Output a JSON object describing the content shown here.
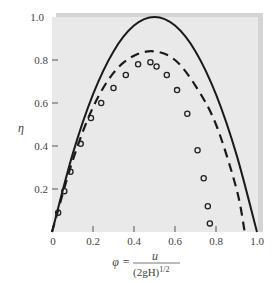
{
  "chart_data": {
    "type": "line",
    "title": "",
    "xlabel": "φ = u / (2gH)^1/2",
    "ylabel": "η",
    "xlim": [
      0,
      1.0
    ],
    "ylim": [
      0,
      1.0
    ],
    "grid": false,
    "background": "#e9e9e9",
    "x_ticks": [
      "0",
      "0.2",
      "0.4",
      "0.6",
      "0.8",
      "1.0"
    ],
    "y_ticks": [
      "0.2",
      "0.4",
      "0.6",
      "0.8",
      "1.0"
    ],
    "series": [
      {
        "name": "theoretical (solid)",
        "style": "solid",
        "x": [
          0,
          0.1,
          0.2,
          0.3,
          0.4,
          0.5,
          0.6,
          0.7,
          0.8,
          0.9,
          1.0
        ],
        "y": [
          0,
          0.36,
          0.64,
          0.84,
          0.96,
          1.0,
          0.96,
          0.84,
          0.64,
          0.36,
          0
        ]
      },
      {
        "name": "theoretical with losses (dashed)",
        "style": "dashed",
        "x": [
          0,
          0.1,
          0.2,
          0.3,
          0.4,
          0.5,
          0.6,
          0.7,
          0.8,
          0.9,
          0.94
        ],
        "y": [
          0,
          0.33,
          0.58,
          0.74,
          0.82,
          0.84,
          0.8,
          0.68,
          0.5,
          0.2,
          0.0
        ]
      },
      {
        "name": "experimental (circles)",
        "style": "markers",
        "x": [
          0.03,
          0.06,
          0.09,
          0.14,
          0.19,
          0.24,
          0.3,
          0.36,
          0.42,
          0.48,
          0.51,
          0.56,
          0.61,
          0.66,
          0.71,
          0.74,
          0.76,
          0.77
        ],
        "y": [
          0.09,
          0.19,
          0.28,
          0.41,
          0.53,
          0.6,
          0.67,
          0.73,
          0.78,
          0.79,
          0.77,
          0.73,
          0.66,
          0.55,
          0.38,
          0.25,
          0.12,
          0.04
        ]
      }
    ]
  },
  "labels": {
    "y_symbol": "η",
    "x_symbol": "φ =",
    "x_numerator": "u",
    "x_denominator": "(2gH)",
    "x_denominator_exp": "1/2",
    "tick_x": [
      "0",
      "0.2",
      "0.4",
      "0.6",
      "0.8",
      "1.0"
    ],
    "tick_y": [
      "0.2",
      "0.4",
      "0.6",
      "0.8",
      "1.0"
    ]
  }
}
